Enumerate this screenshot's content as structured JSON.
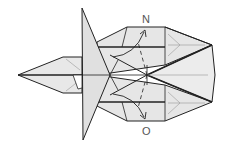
{
  "diagram": {
    "type": "origami-fold-step",
    "colors": {
      "paper": "#e6e6e6",
      "paper_light": "#efefef",
      "line": "#222222",
      "crease": "#888888",
      "background": "#ffffff"
    },
    "labels": {
      "top": "N",
      "bottom": "O"
    },
    "arrows": [
      {
        "name": "fold-arrow-upper",
        "direction": "up-right",
        "target": "N"
      },
      {
        "name": "fold-arrow-lower",
        "direction": "down-right",
        "target": "O"
      }
    ],
    "dashed_lines": [
      {
        "name": "valley-fold-upper",
        "from": "center",
        "to": "N"
      },
      {
        "name": "valley-fold-lower",
        "from": "center",
        "to": "O"
      }
    ]
  }
}
